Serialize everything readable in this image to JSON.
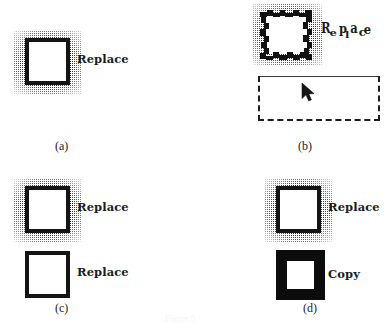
{
  "figure": {
    "background_color": "#ffffff",
    "ink_color": "#1b1b1b",
    "stipple_color": "#2e2e2e"
  },
  "panels": [
    {
      "id": "a",
      "caption": "(a)",
      "items": [
        {
          "label": "Replace",
          "icon_name": "square-outline-icon",
          "background": "stippled",
          "border": "thin"
        }
      ]
    },
    {
      "id": "b",
      "caption": "(b)",
      "items": [
        {
          "label": "Replace",
          "label_state": "jittered",
          "icon_name": "square-outline-jagged-icon",
          "background": "stippled",
          "border": "jagged"
        }
      ],
      "selection_rectangle": {
        "name": "dashed-selection-rectangle",
        "top_edge": "solid-wavy",
        "other_edges": "dashed"
      },
      "cursor": {
        "name": "mouse-pointer-icon"
      }
    },
    {
      "id": "c",
      "caption": "(c)",
      "items": [
        {
          "label": "Replace",
          "icon_name": "square-outline-icon",
          "background": "stippled",
          "border": "thin"
        },
        {
          "label": "Replace",
          "icon_name": "square-outline-icon",
          "background": "plain",
          "border": "thin"
        }
      ]
    },
    {
      "id": "d",
      "caption": "(d)",
      "items": [
        {
          "label": "Replace",
          "icon_name": "square-outline-icon",
          "background": "stippled",
          "border": "thin"
        },
        {
          "label": "Copy",
          "icon_name": "square-solid-thick-icon",
          "background": "plain",
          "border": "thick"
        }
      ]
    }
  ],
  "jitter_glyphs": {
    "replace": [
      "R",
      "e",
      "p",
      "l",
      "a",
      "c",
      "e"
    ]
  },
  "footer": {
    "faint_text": "Figure 5"
  }
}
